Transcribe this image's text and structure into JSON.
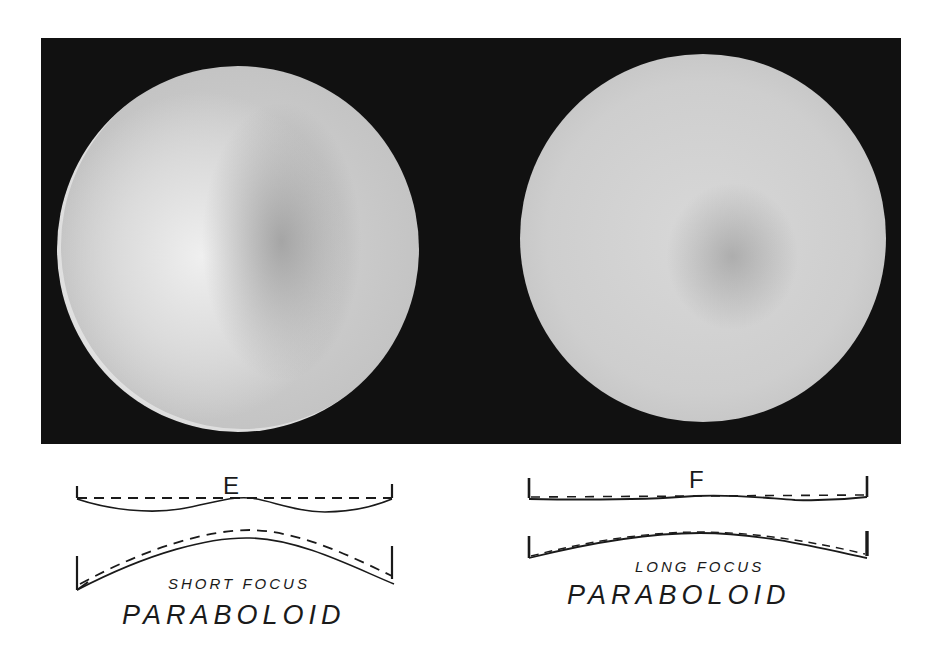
{
  "figure": {
    "photos": [
      {
        "id": "E",
        "description": "short-focus paraboloid mirror under knife-edge test"
      },
      {
        "id": "F",
        "description": "long-focus paraboloid mirror under knife-edge test"
      }
    ],
    "diagrams": [
      {
        "letter": "E",
        "small_caption": "SHORT FOCUS",
        "big_caption": "PARABOLOID"
      },
      {
        "letter": "F",
        "small_caption": "LONG FOCUS",
        "big_caption": "PARABOLOID"
      }
    ]
  },
  "colors": {
    "panel_background": "#111111",
    "ink": "#1a1a1a",
    "page": "#ffffff"
  }
}
